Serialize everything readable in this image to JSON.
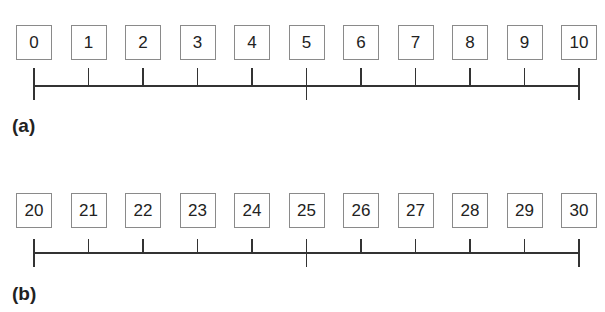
{
  "panels": [
    {
      "label": "(a)",
      "values": [
        "0",
        "1",
        "2",
        "3",
        "4",
        "5",
        "6",
        "7",
        "8",
        "9",
        "10"
      ]
    },
    {
      "label": "(b)",
      "values": [
        "20",
        "21",
        "22",
        "23",
        "24",
        "25",
        "26",
        "27",
        "28",
        "29",
        "30"
      ]
    }
  ],
  "colors": {
    "box_border": "#8a8a8a",
    "line": "#333333",
    "text": "#222222"
  }
}
